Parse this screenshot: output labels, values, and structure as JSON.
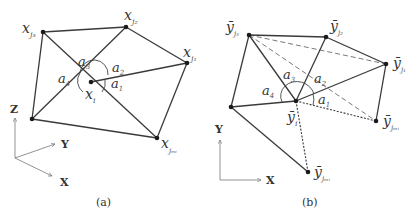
{
  "panel_a": {
    "caption": "(a)",
    "nodes": {
      "x_j3": {
        "base": "x",
        "sub": "j₃"
      },
      "x_j2": {
        "base": "x",
        "sub": "j₂"
      },
      "x_j1": {
        "base": "x",
        "sub": "j₁"
      },
      "x_i": {
        "base": "x",
        "sub": "i"
      },
      "x_jmi": {
        "base": "x",
        "sub": "jₘᵢ"
      }
    },
    "angles": [
      "a",
      "1",
      "2",
      "3",
      "4"
    ],
    "angle_labels": {
      "a1_sub": "1",
      "a2_sub": "2",
      "a3_sub": "3",
      "a4_sub": "4",
      "base": "a"
    },
    "axes": {
      "z": "Z",
      "y": "Y",
      "x": "X"
    }
  },
  "panel_b": {
    "caption": "(b)",
    "nodes": {
      "y_j3": {
        "base": "ȳ",
        "sub": "j₃"
      },
      "y_j2": {
        "base": "ȳ",
        "sub": "j₂"
      },
      "y_j1": {
        "base": "ȳ",
        "sub": "j₁"
      },
      "y_i": {
        "base": "ȳ",
        "sub": "i"
      },
      "y_jmi_right": {
        "base": "ȳ",
        "sub": "jₘᵢ"
      },
      "y_jmi_bottom": {
        "base": "ȳ",
        "sub": "jₘᵢ"
      }
    },
    "angle_labels": {
      "a1_sub": "1",
      "a2_sub": "2",
      "a3_sub": "3",
      "a4_sub": "4",
      "base": "a"
    },
    "axes": {
      "y": "Y",
      "x": "X"
    }
  }
}
